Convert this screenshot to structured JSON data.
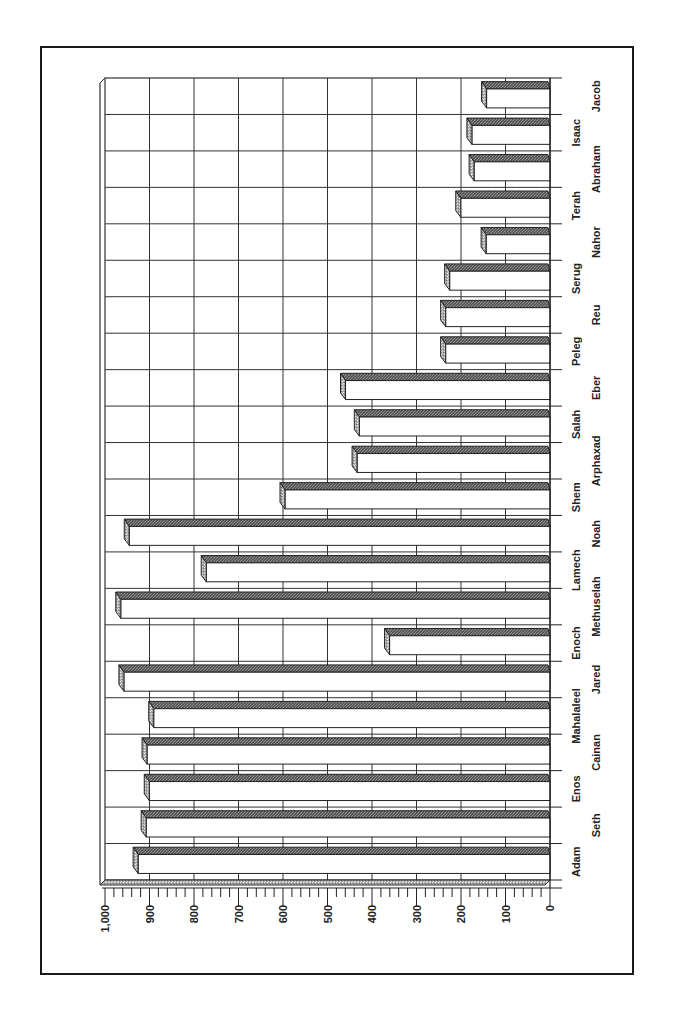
{
  "chart_data": {
    "type": "bar",
    "orientation": "rotated-90-clockwise",
    "title": "",
    "xlabel": "",
    "ylabel": "",
    "ylim": [
      0,
      1000
    ],
    "yticks": [
      "0",
      "100",
      "200",
      "300",
      "400",
      "500",
      "600",
      "700",
      "800",
      "900",
      "1,000"
    ],
    "grid": true,
    "legend": null,
    "style": "3d",
    "categories": [
      "Adam",
      "Seth",
      "Enos",
      "Cainan",
      "Mahalaleel",
      "Jared",
      "Enoch",
      "Methuselah",
      "Lamech",
      "Noah",
      "Shem",
      "Arphaxad",
      "Salah",
      "Eber",
      "Peleg",
      "Reu",
      "Serug",
      "Nahor",
      "Terah",
      "Abraham",
      "Isaac",
      "Jacob"
    ],
    "values": [
      930,
      912,
      905,
      910,
      895,
      962,
      365,
      969,
      777,
      950,
      600,
      438,
      433,
      464,
      239,
      239,
      230,
      148,
      205,
      175,
      180,
      147
    ]
  },
  "colors": {
    "frame": "#1a1a1a",
    "grid": "#333333",
    "bar_face": "#ffffff",
    "bar_top": "#4a4a4a",
    "bar_side": "#9a9a9a",
    "floor": "#b5b5b5"
  }
}
